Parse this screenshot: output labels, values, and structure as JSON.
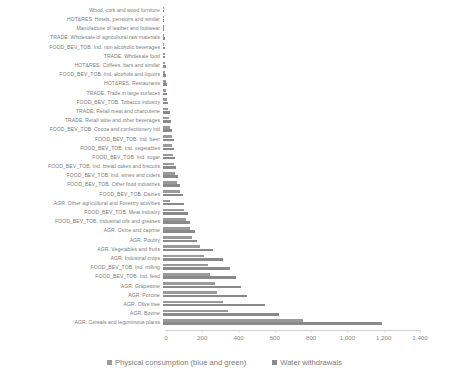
{
  "chart_data": {
    "type": "bar",
    "orientation": "horizontal",
    "title": "",
    "subtitle": "",
    "xlabel": "",
    "ylabel": "",
    "xlim": [
      0,
      1400
    ],
    "xticks": [
      0,
      200,
      400,
      600,
      800,
      1000,
      1200,
      1400
    ],
    "xtick_labels": [
      "0",
      "200",
      "400",
      "600",
      "800",
      "1,000",
      "1,200",
      "1,400"
    ],
    "grid": false,
    "legend_position": "bottom",
    "colors": {
      "consumption": "#9a9a9a",
      "withdrawals": "#8a8a8a",
      "axis": "#d0d0d0",
      "text": "#7b7b7b"
    },
    "legend": [
      "Physical consumption (blue and green)",
      "Water withdrawals"
    ],
    "categories": [
      "Wood, cork and wood furniture",
      "HOT&RES. Hotels, pensions and similar",
      "Manufacture of leather and footwear",
      "TRADE. Wholesale of agricultural raw materials",
      "FOOD_BEV_TOB. Ind. non alcoholic beverages",
      "TRADE. Wholesale food",
      "HOT&RES. Coffees, bars and similar",
      "FOOD_BEV_TOB. Ind. alcohols and liquors",
      "HOT&RES. Restaurants",
      "TRADE. Trade in large surfaces",
      "FOOD_BEV_TOB. Tobacco industry",
      "TRADE. Retail meat and charcuterie",
      "TRADE. Retail wine and other beverages",
      "FOOD_BEV_TOB. Cocoa and confectionery ind",
      "FOOD_BEV_TOB. Ind. beer",
      "FOOD_BEV_TOB. Ind. vegetables",
      "FOOD_BEV_TOB. Ind. sugar",
      "FOOD_BEV_TOB. Ind. bread cakes and biscuits",
      "FOOD_BEV_TOB. Ind. wines and ciders",
      "FOOD_BEV_TOB. Other food industries",
      "FOOD_BEV_TOB. Dairies",
      "AGR. Other agricultural and Forestry activities",
      "FOOD_BEV_TOB. Meat industry",
      "FOOD_BEV_TOB. Industrial oils and greases",
      "AGR. Ovine and caprine",
      "AGR. Poultry",
      "AGR. Vegetables and fruits",
      "AGR. Industrial crops",
      "FOOD_BEV_TOB. Ind. milling",
      "FOOD_BEV_TOB. Ind. feed",
      "AGR. Grapewine",
      "AGR. Porcine",
      "AGR. Olive tree",
      "AGR. Bovine",
      "AGR. Cereals and leguminous plants"
    ],
    "series": [
      {
        "name": "Physical consumption (blue and green)",
        "values": [
          3,
          6,
          6,
          8,
          8,
          10,
          11,
          12,
          17,
          19,
          22,
          30,
          34,
          40,
          48,
          52,
          55,
          60,
          68,
          78,
          96,
          40,
          118,
          128,
          150,
          160,
          205,
          225,
          250,
          260,
          285,
          300,
          330,
          360,
          770
        ]
      },
      {
        "name": "Water withdrawals",
        "values": [
          3,
          7,
          7,
          9,
          10,
          12,
          14,
          15,
          22,
          24,
          28,
          36,
          42,
          48,
          58,
          62,
          66,
          74,
          84,
          95,
          110,
          115,
          140,
          150,
          175,
          190,
          275,
          330,
          370,
          400,
          430,
          465,
          560,
          640,
          1205
        ]
      }
    ]
  }
}
